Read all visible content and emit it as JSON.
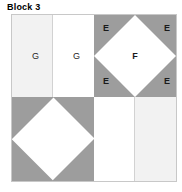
{
  "title": "Block 3",
  "block": {
    "name": "Block 3",
    "colors": {
      "gray": "#9d9d9d",
      "light_gray": "#f2f2f2",
      "white": "#ffffff",
      "border": "#c8c8c8",
      "label_text": "#1a1a1a"
    },
    "quadrants": {
      "top_left": {
        "type": "two-rectangles",
        "patches": [
          {
            "label": "G",
            "fill": "light_gray"
          },
          {
            "label": "G",
            "fill": "white"
          }
        ]
      },
      "top_right": {
        "type": "square-in-a-square",
        "center": {
          "label": "F",
          "fill": "white"
        },
        "corners": [
          {
            "label": "E",
            "position": "top-left",
            "fill": "gray"
          },
          {
            "label": "E",
            "position": "top-right",
            "fill": "gray"
          },
          {
            "label": "E",
            "position": "bottom-left",
            "fill": "gray"
          },
          {
            "label": "E",
            "position": "bottom-right",
            "fill": "gray"
          }
        ]
      },
      "bottom_left": {
        "type": "square-in-a-square",
        "center": {
          "label": "",
          "fill": "white"
        },
        "corners": [
          {
            "label": "",
            "position": "top-left",
            "fill": "gray"
          },
          {
            "label": "",
            "position": "top-right",
            "fill": "gray"
          },
          {
            "label": "",
            "position": "bottom-left",
            "fill": "gray"
          },
          {
            "label": "",
            "position": "bottom-right",
            "fill": "gray"
          }
        ]
      },
      "bottom_right": {
        "type": "two-rectangles",
        "patches": [
          {
            "label": "",
            "fill": "white"
          },
          {
            "label": "",
            "fill": "light_gray"
          }
        ]
      }
    }
  }
}
